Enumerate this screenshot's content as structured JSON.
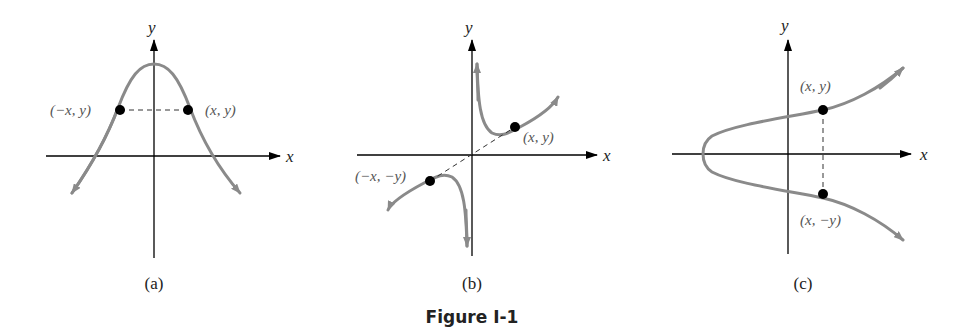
{
  "figure": {
    "caption": "Figure I-1",
    "colors": {
      "axis": "#000000",
      "curve": "#8a8a8a",
      "point": "#000000",
      "label": "#555555"
    }
  },
  "panels": [
    {
      "id": "a",
      "sublabel": "(a)",
      "x_axis_label": "x",
      "y_axis_label": "y",
      "symmetry": "y-axis",
      "points": [
        {
          "label": "(−x, y)"
        },
        {
          "label": "(x, y)"
        }
      ]
    },
    {
      "id": "b",
      "sublabel": "(b)",
      "x_axis_label": "x",
      "y_axis_label": "y",
      "symmetry": "origin",
      "points": [
        {
          "label": "(x, y)"
        },
        {
          "label": "(−x, −y)"
        }
      ]
    },
    {
      "id": "c",
      "sublabel": "(c)",
      "x_axis_label": "x",
      "y_axis_label": "y",
      "symmetry": "x-axis",
      "points": [
        {
          "label": "(x, y)"
        },
        {
          "label": "(x, −y)"
        }
      ]
    }
  ]
}
